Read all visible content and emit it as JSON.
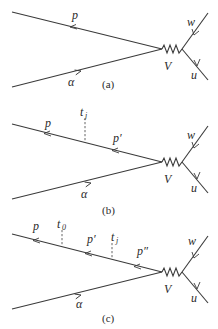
{
  "panels": [
    {
      "caption": "(a)",
      "labels": {
        "outgoing": "p",
        "incoming": "α",
        "vertex": "V",
        "w": "w",
        "u": "u"
      },
      "times": []
    },
    {
      "caption": "(b)",
      "labels": {
        "outgoing": "p",
        "mid1": "p′",
        "incoming": "α",
        "vertex": "V",
        "w": "w",
        "u": "u"
      },
      "times": [
        {
          "t": "t",
          "sub": "j"
        }
      ]
    },
    {
      "caption": "(c)",
      "labels": {
        "outgoing": "p",
        "mid1": "p′",
        "mid2": "p″",
        "incoming": "α",
        "vertex": "V",
        "w": "w",
        "u": "u"
      },
      "times": [
        {
          "t": "t",
          "sub": "0"
        },
        {
          "t": "t",
          "sub": "j"
        }
      ]
    }
  ],
  "colors": {
    "line": "#3a3a3a",
    "text": "#2a2a2a",
    "background": "#ffffff"
  }
}
